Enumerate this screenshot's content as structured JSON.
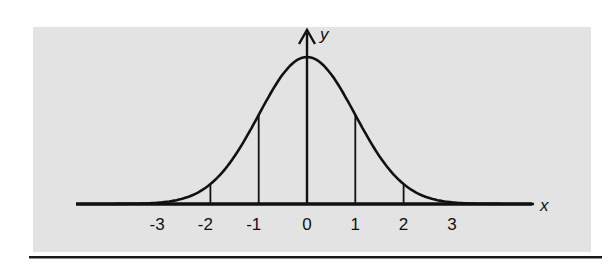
{
  "chart_data": {
    "type": "line",
    "title": "",
    "xlabel": "x",
    "ylabel": "y",
    "xlim": [
      -4.7,
      4.7
    ],
    "x_ticks": [
      -3,
      -2,
      -1,
      0,
      1,
      2,
      3
    ],
    "x_tick_labels": [
      "-3",
      "-2",
      "-1",
      "0",
      "1",
      "2",
      "3"
    ],
    "ordinates_at": [
      -3,
      -2,
      -1,
      0,
      1,
      2,
      3
    ],
    "series": [
      {
        "name": "normal curve",
        "x": [
          -4,
          -3,
          -2,
          -1,
          0,
          1,
          2,
          3,
          4
        ],
        "values": [
          0.0001,
          0.0044,
          0.054,
          0.242,
          0.3989,
          0.242,
          0.054,
          0.0044,
          0.0001
        ]
      }
    ],
    "grid": false,
    "legend": "none",
    "background": "#e3e3e3"
  },
  "colors": {
    "panel": "#e3e3e3",
    "ink": "#111111",
    "rule": "#1a1a1a"
  }
}
